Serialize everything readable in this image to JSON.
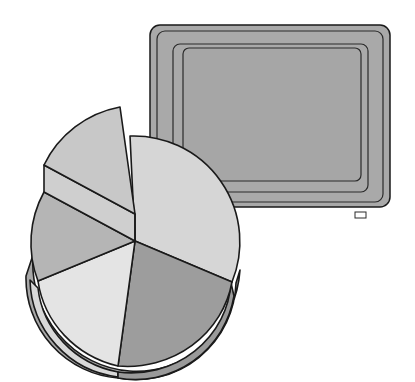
{
  "illustration": {
    "description": "Clip art of an exploded 3D pie chart in front of a monitor screen",
    "colors": {
      "background": "#ffffff",
      "screen_bezel": "#a9a9a9",
      "screen_face": "#a6a6a6",
      "outline": "#1a1a1a",
      "slice_light": "#d9d9d9",
      "slice_lighter": "#e6e6e6",
      "slice_mid": "#bdbdbd",
      "slice_dark": "#9a9a9a",
      "slice_exploded": "#c6c6c6"
    },
    "pie_slices": [
      {
        "name": "right-large",
        "fill": "#d6d6d6"
      },
      {
        "name": "bottom-right",
        "fill": "#9d9d9d"
      },
      {
        "name": "bottom-left",
        "fill": "#e4e4e4"
      },
      {
        "name": "left",
        "fill": "#b5b5b5"
      },
      {
        "name": "exploded-top",
        "fill": "#c8c8c8"
      }
    ]
  }
}
